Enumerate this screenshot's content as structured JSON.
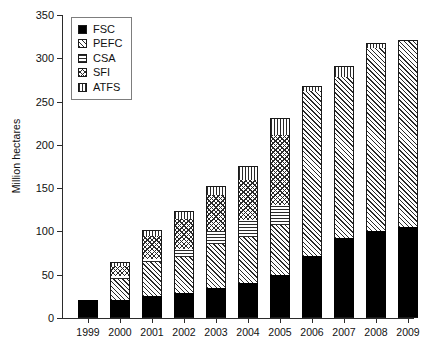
{
  "chart_data": {
    "type": "bar",
    "stacked": true,
    "title": "",
    "xlabel": "",
    "ylabel": "Million hectares",
    "ylim": [
      0,
      350
    ],
    "yticks": [
      0,
      50,
      100,
      150,
      200,
      250,
      300,
      350
    ],
    "grid": false,
    "legend_position": "top-left",
    "categories": [
      "1999",
      "2000",
      "2001",
      "2002",
      "2003",
      "2004",
      "2005",
      "2006",
      "2007",
      "2008",
      "2009"
    ],
    "series": [
      {
        "name": "FSC",
        "pattern": "solid-black",
        "values": [
          20,
          21,
          25,
          29,
          35,
          41,
          50,
          72,
          92,
          100,
          105
        ]
      },
      {
        "name": "PEFC",
        "pattern": "diagonal-hatch",
        "values": [
          0,
          24,
          40,
          42,
          51,
          53,
          58,
          190,
          186,
          212,
          215
        ]
      },
      {
        "name": "CSA",
        "pattern": "horizontal-lines",
        "values": [
          0,
          4,
          3,
          9,
          15,
          19,
          22,
          0,
          0,
          0,
          0
        ]
      },
      {
        "name": "SFI",
        "pattern": "cross-hatch",
        "values": [
          0,
          11,
          27,
          34,
          41,
          47,
          81,
          0,
          0,
          0,
          0
        ]
      },
      {
        "name": "ATFS",
        "pattern": "vertical-lines",
        "values": [
          0,
          3,
          6,
          8,
          9,
          15,
          19,
          5,
          12,
          4,
          0
        ]
      }
    ],
    "totals": [
      20,
      63,
      101,
      122,
      151,
      175,
      230,
      267,
      290,
      316,
      320
    ]
  },
  "legend": {
    "items": [
      {
        "label": "FSC"
      },
      {
        "label": "PEFC"
      },
      {
        "label": "CSA"
      },
      {
        "label": "SFI"
      },
      {
        "label": "ATFS"
      }
    ]
  },
  "colors": {
    "axis": "#2b2b2b",
    "ink": "#1a1a1a",
    "hatch": "#2a2a2a",
    "background": "#ffffff",
    "legend_border": "#7d7d7d"
  }
}
